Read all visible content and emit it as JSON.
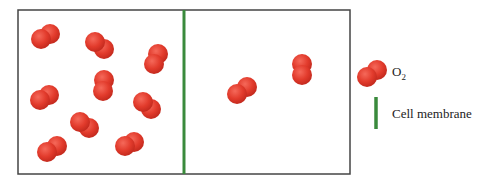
{
  "diagram": {
    "box": {
      "x": 18,
      "y": 10,
      "w": 332,
      "h": 164,
      "stroke": "#444444"
    },
    "membrane": {
      "x": 184,
      "color": "#3a8a3c"
    },
    "molecule_color": "#e23b2c",
    "molecules_left": [
      {
        "x1": 41,
        "y1": 39,
        "x2": 50,
        "y2": 34
      },
      {
        "x1": 95,
        "y1": 42,
        "x2": 104,
        "y2": 49
      },
      {
        "x1": 154,
        "y1": 64,
        "x2": 158,
        "y2": 54
      },
      {
        "x1": 103,
        "y1": 91,
        "x2": 104,
        "y2": 80
      },
      {
        "x1": 40,
        "y1": 100,
        "x2": 49,
        "y2": 95
      },
      {
        "x1": 143,
        "y1": 102,
        "x2": 151,
        "y2": 109
      },
      {
        "x1": 80,
        "y1": 122,
        "x2": 89,
        "y2": 128
      },
      {
        "x1": 47,
        "y1": 152,
        "x2": 57,
        "y2": 146
      },
      {
        "x1": 125,
        "y1": 146,
        "x2": 134,
        "y2": 142
      }
    ],
    "molecules_right": [
      {
        "x1": 237,
        "y1": 94,
        "x2": 247,
        "y2": 87
      },
      {
        "x1": 302,
        "y1": 75,
        "x2": 302,
        "y2": 64
      }
    ]
  },
  "legend": {
    "o2_label": "O",
    "o2_subscript": "2",
    "membrane_label": "Cell membrane"
  }
}
